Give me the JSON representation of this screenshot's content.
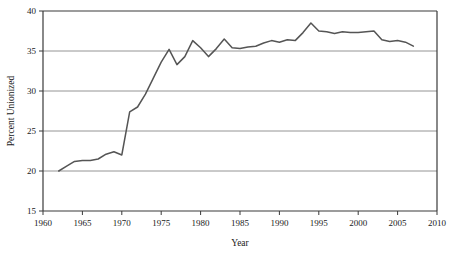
{
  "chart_data": {
    "type": "line",
    "title": "",
    "xlabel": "Year",
    "ylabel": "Percent Unionized",
    "xlim": [
      1960,
      2010
    ],
    "ylim": [
      15,
      40
    ],
    "xticks": [
      1960,
      1965,
      1970,
      1975,
      1980,
      1985,
      1990,
      1995,
      2000,
      2005,
      2010
    ],
    "yticks": [
      15,
      20,
      25,
      30,
      35,
      40
    ],
    "grid": "horizontal",
    "legend": "none",
    "line_color": "#555555",
    "series": [
      {
        "name": "Percent Unionized",
        "x": [
          1962,
          1963,
          1964,
          1965,
          1966,
          1967,
          1968,
          1969,
          1970,
          1971,
          1972,
          1973,
          1974,
          1975,
          1976,
          1977,
          1978,
          1979,
          1980,
          1981,
          1982,
          1983,
          1984,
          1985,
          1986,
          1987,
          1988,
          1989,
          1990,
          1991,
          1992,
          1993,
          1994,
          1995,
          1996,
          1997,
          1998,
          1999,
          2000,
          2001,
          2002,
          2003,
          2004,
          2005,
          2006,
          2007
        ],
        "values": [
          20.0,
          20.6,
          21.2,
          21.3,
          21.3,
          21.5,
          22.1,
          22.4,
          22.0,
          27.4,
          28.0,
          29.6,
          31.6,
          33.6,
          35.2,
          33.3,
          34.3,
          36.3,
          35.4,
          34.3,
          35.3,
          36.5,
          35.4,
          35.3,
          35.5,
          35.6,
          36.0,
          36.3,
          36.1,
          36.4,
          36.3,
          37.3,
          38.5,
          37.5,
          37.4,
          37.2,
          37.4,
          37.3,
          37.3,
          37.4,
          37.5,
          36.4,
          36.2,
          36.3,
          36.1,
          35.6
        ]
      }
    ]
  },
  "axis": {
    "y_title": "Percent Unionized",
    "x_title": "Year",
    "y_tick_labels": [
      "40",
      "35",
      "30",
      "25",
      "20",
      "15"
    ],
    "x_tick_labels": [
      "1960",
      "1965",
      "1970",
      "1975",
      "1980",
      "1985",
      "1990",
      "1995",
      "2000",
      "2005",
      "2010"
    ]
  },
  "colors": {
    "line": "#555555",
    "grid": "#888888",
    "axis": "#3a3a3a",
    "background": "#ffffff"
  }
}
